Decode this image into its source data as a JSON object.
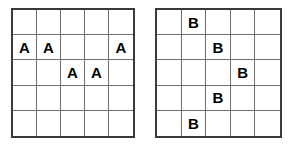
{
  "diagram": {
    "type": "letter-placement-grids",
    "background_color": "#ffffff",
    "outer_border_color": "#3a3a3a",
    "inner_line_color": "#6f6f6f",
    "letter_color": "#000000",
    "grids": [
      {
        "id": "grid-a",
        "name": "left-grid",
        "rows": 5,
        "columns": 5,
        "letter": "A",
        "cells": [
          [
            "",
            "",
            "",
            "",
            ""
          ],
          [
            "A",
            "A",
            "",
            "",
            "A"
          ],
          [
            "",
            "",
            "A",
            "A",
            ""
          ],
          [
            "",
            "",
            "",
            "",
            ""
          ],
          [
            "",
            "",
            "",
            "",
            ""
          ]
        ]
      },
      {
        "id": "grid-b",
        "name": "right-grid",
        "rows": 5,
        "columns": 5,
        "letter": "B",
        "cells": [
          [
            "",
            "B",
            "",
            "",
            ""
          ],
          [
            "",
            "",
            "B",
            "",
            ""
          ],
          [
            "",
            "",
            "",
            "B",
            ""
          ],
          [
            "",
            "",
            "B",
            "",
            ""
          ],
          [
            "",
            "B",
            "",
            "",
            ""
          ]
        ]
      }
    ]
  }
}
